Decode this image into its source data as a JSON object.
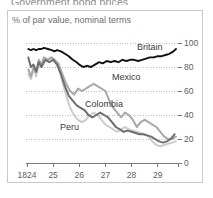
{
  "chart_title": "Government bond prices",
  "subtitle": "% of par value, nominal terms",
  "axis": {
    "y_ticks": [
      "0",
      "20",
      "40",
      "60",
      "80",
      "100"
    ],
    "x_ticks": [
      "1824",
      "25",
      "26",
      "27",
      "28",
      "29"
    ]
  },
  "labels": {
    "britain": "Britain",
    "mexico": "Mexico",
    "colombia": "Colombia",
    "peru": "Peru"
  },
  "colors": {
    "britain": "#111111",
    "colombia": "#6e6e6e",
    "mexico": "#a8a8a8",
    "peru": "#cccccc",
    "grid": "#bdbdbd",
    "frame": "#c9c9c9",
    "axis": "#7a7a7a",
    "text": "#5d5d5d"
  },
  "chart_data": {
    "type": "line",
    "title": "Government bond prices",
    "subtitle": "% of par value, nominal terms",
    "xlabel": "",
    "ylabel": "% of par value, nominal terms",
    "xlim": [
      1824.0,
      1829.7
    ],
    "ylim": [
      0,
      100
    ],
    "y_ticks": [
      0,
      20,
      40,
      60,
      80,
      100
    ],
    "x_ticks": [
      1824,
      1825,
      1826,
      1827,
      1828,
      1829
    ],
    "x_tick_labels": [
      "1824",
      "25",
      "26",
      "27",
      "28",
      "29"
    ],
    "grid": "horizontal-dotted",
    "legend": "inline-annotations",
    "series": [
      {
        "name": "Britain",
        "color": "#111111",
        "x": [
          1824.05,
          1824.15,
          1824.25,
          1824.35,
          1824.45,
          1824.55,
          1824.65,
          1824.8,
          1824.95,
          1825.05,
          1825.15,
          1825.3,
          1825.45,
          1825.6,
          1825.75,
          1825.9,
          1826.0,
          1826.15,
          1826.3,
          1826.45,
          1826.6,
          1826.75,
          1826.9,
          1827.05,
          1827.2,
          1827.35,
          1827.5,
          1827.65,
          1827.8,
          1827.95,
          1828.1,
          1828.25,
          1828.4,
          1828.55,
          1828.7,
          1828.85,
          1829.0,
          1829.15,
          1829.3,
          1829.45,
          1829.6,
          1829.7
        ],
        "y": [
          95,
          94,
          95,
          94,
          95,
          95,
          96,
          95,
          94,
          93,
          94,
          93,
          91,
          89,
          86,
          84,
          82,
          80,
          81,
          80,
          82,
          84,
          83,
          85,
          84,
          85,
          84,
          86,
          85,
          86,
          86,
          85,
          86,
          87,
          88,
          88,
          89,
          89,
          90,
          91,
          93,
          95
        ]
      },
      {
        "name": "Mexico",
        "color": "#a8a8a8",
        "x": [
          1824.05,
          1824.15,
          1824.25,
          1824.35,
          1824.45,
          1824.55,
          1824.65,
          1824.8,
          1824.95,
          1825.05,
          1825.2,
          1825.35,
          1825.5,
          1825.65,
          1825.8,
          1825.95,
          1826.1,
          1826.25,
          1826.4,
          1826.55,
          1826.7,
          1826.85,
          1827.0,
          1827.15,
          1827.3,
          1827.45,
          1827.6,
          1827.75,
          1827.9,
          1828.05,
          1828.2,
          1828.35,
          1828.5,
          1828.65,
          1828.8,
          1828.95,
          1829.1,
          1829.25,
          1829.4,
          1829.55,
          1829.7
        ],
        "y": [
          78,
          72,
          80,
          76,
          86,
          82,
          88,
          86,
          88,
          86,
          83,
          74,
          66,
          60,
          57,
          62,
          60,
          62,
          64,
          66,
          64,
          62,
          60,
          52,
          46,
          42,
          38,
          42,
          40,
          36,
          30,
          34,
          36,
          34,
          32,
          30,
          26,
          22,
          20,
          20,
          22
        ]
      },
      {
        "name": "Colombia",
        "color": "#6e6e6e",
        "x": [
          1824.05,
          1824.15,
          1824.25,
          1824.35,
          1824.45,
          1824.55,
          1824.7,
          1824.85,
          1825.0,
          1825.15,
          1825.3,
          1825.45,
          1825.6,
          1825.75,
          1825.9,
          1826.05,
          1826.2,
          1826.35,
          1826.5,
          1826.65,
          1826.8,
          1826.95,
          1827.1,
          1827.25,
          1827.4,
          1827.55,
          1827.7,
          1827.85,
          1828.0,
          1828.15,
          1828.3,
          1828.45,
          1828.6,
          1828.75,
          1828.9,
          1829.05,
          1829.2,
          1829.35,
          1829.5,
          1829.65
        ],
        "y": [
          88,
          80,
          82,
          76,
          84,
          80,
          86,
          84,
          86,
          82,
          74,
          64,
          56,
          52,
          48,
          46,
          44,
          40,
          38,
          40,
          42,
          40,
          38,
          34,
          30,
          28,
          26,
          27,
          26,
          25,
          24,
          24,
          23,
          22,
          20,
          18,
          17,
          18,
          20,
          24
        ]
      },
      {
        "name": "Peru",
        "color": "#cccccc",
        "x": [
          1824.05,
          1824.15,
          1824.25,
          1824.35,
          1824.45,
          1824.6,
          1824.75,
          1824.9,
          1825.05,
          1825.2,
          1825.35,
          1825.5,
          1825.65,
          1825.8,
          1825.95,
          1826.1,
          1826.25,
          1826.4,
          1826.55,
          1826.7,
          1826.85,
          1827.0,
          1827.15,
          1827.3,
          1827.45,
          1827.6,
          1827.75,
          1827.9,
          1828.05,
          1828.2,
          1828.35,
          1828.5,
          1828.65,
          1828.8,
          1828.95,
          1829.1,
          1829.25,
          1829.4,
          1829.55,
          1829.7
        ],
        "y": [
          74,
          70,
          78,
          72,
          82,
          84,
          86,
          88,
          86,
          80,
          68,
          56,
          46,
          40,
          36,
          34,
          36,
          40,
          42,
          40,
          36,
          32,
          30,
          28,
          26,
          28,
          30,
          28,
          27,
          26,
          25,
          24,
          22,
          18,
          15,
          14,
          15,
          16,
          17,
          18
        ]
      }
    ]
  }
}
